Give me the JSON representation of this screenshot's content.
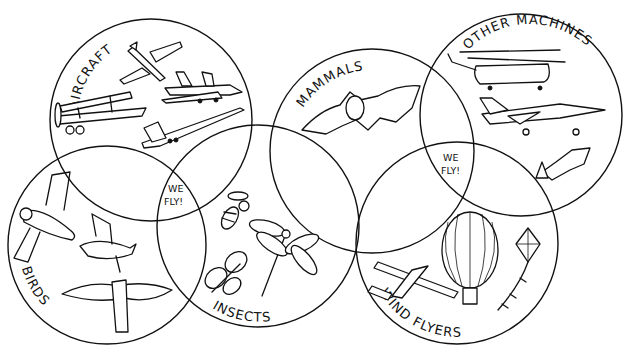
{
  "colors": {
    "ink": "#111111",
    "background": "#ffffff"
  },
  "groups": [
    {
      "id": "aircraft",
      "label": "AIRCRAFT",
      "items": [
        "light-plane",
        "jet-airliner",
        "biplane",
        "supersonic-airliner"
      ]
    },
    {
      "id": "birds",
      "label": "BIRDS",
      "items": [
        "owl",
        "dove",
        "eagle"
      ]
    },
    {
      "id": "insects",
      "label": "INSECTS",
      "items": [
        "bee",
        "butterfly",
        "dragonfly"
      ]
    },
    {
      "id": "mammals",
      "label": "MAMMALS",
      "items": [
        "bat"
      ]
    },
    {
      "id": "other_machines",
      "label": "OTHER MACHINES",
      "items": [
        "helicopter",
        "jet-fighter",
        "rocket"
      ]
    },
    {
      "id": "wind_flyers",
      "label": "WIND FLYERS",
      "items": [
        "glider",
        "hot-air-balloon",
        "kite"
      ]
    }
  ],
  "overlap_labels": [
    {
      "line1": "WE",
      "line2": "FLY!"
    },
    {
      "line1": "WE",
      "line2": "FLY!"
    }
  ]
}
